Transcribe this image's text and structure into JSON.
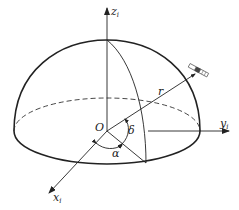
{
  "diagram": {
    "type": "celestial-coordinate-hemisphere",
    "colors": {
      "stroke": "#222222",
      "background": "#ffffff"
    },
    "labels": {
      "origin": "O",
      "z_axis": "z",
      "z_axis_sub": "i",
      "y_axis": "y",
      "y_axis_sub": "i",
      "x_axis": "x",
      "x_axis_sub": "i",
      "radius": "r",
      "declination": "δ",
      "right_ascension": "α"
    },
    "icons": {
      "satellite": "satellite-icon"
    }
  }
}
